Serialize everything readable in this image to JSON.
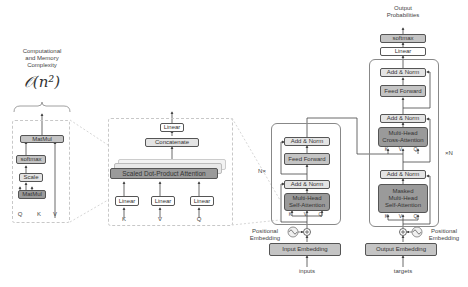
{
  "complexity": {
    "caption_line1": "Computational",
    "caption_line2": "and Memory",
    "caption_line3": "Complexity",
    "formula": "𝒪(n²)"
  },
  "sdpa_detail": {
    "matmul_top": "MatMul",
    "softmax": "softmax",
    "scale": "Scale",
    "matmul_bottom": "MatMul",
    "inputs": [
      "Q",
      "K",
      "V"
    ]
  },
  "mha_detail": {
    "linear_top": "Linear",
    "concatenate": "Concatenate",
    "attention": "Scaled Dot-Product Attention",
    "linear_k": "Linear",
    "linear_v": "Linear",
    "linear_q": "Linear",
    "inputs": [
      "K",
      "V",
      "Q"
    ]
  },
  "encoder": {
    "repeat_label": "N×",
    "add_norm_top": "Add & Norm",
    "feed_forward": "Feed Forward",
    "add_norm_bottom": "Add & Norm",
    "attention_line1": "Multi-Head",
    "attention_line2": "Self-Attention",
    "attn_inputs": [
      "K",
      "V",
      "Q"
    ],
    "pos_label_line1": "Positional",
    "pos_label_line2": "Embedding",
    "embedding": "Input Embedding",
    "input_label": "inputs"
  },
  "decoder": {
    "output_line1": "Output",
    "output_line2": "Probabilities",
    "softmax": "softmax",
    "linear": "Linear",
    "repeat_label": "×N",
    "add_norm_top": "Add & Norm",
    "feed_forward": "Feed Forward",
    "add_norm_mid": "Add & Norm",
    "cross_line1": "Multi-Head",
    "cross_line2": "Cross-Attention",
    "cross_inputs": [
      "K",
      "V",
      "Q"
    ],
    "add_norm_bottom": "Add & Norm",
    "masked_line1": "Masked",
    "masked_line2": "Multi-Head",
    "masked_line3": "Self-Attention",
    "masked_inputs": [
      "K",
      "V",
      "Q"
    ],
    "pos_label_line1": "Positional",
    "pos_label_line2": "Embedding",
    "embedding": "Output Embedding",
    "input_label": "targets"
  },
  "colors": {
    "dark_block": "#9a9a9a",
    "mid_block": "#c4c4c4",
    "light_block": "#e4e4e4",
    "line": "#444444",
    "dashed": "#c8c8c8"
  }
}
